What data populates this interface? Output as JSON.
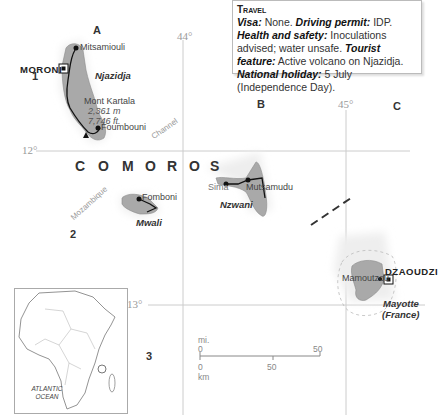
{
  "travel_box": {
    "title": "Travel",
    "items": [
      {
        "label": "Visa:",
        "value": " None. "
      },
      {
        "label": "Driving permit:",
        "value": " IDP. "
      },
      {
        "label": "Health and safety:",
        "value": " Inoculations advised; water unsafe. "
      },
      {
        "label": "Tourist feature:",
        "value": " Active volcano on Njazidja. "
      },
      {
        "label": "National holiday:",
        "value": " 5 July (Independence Day)."
      }
    ]
  },
  "grid": {
    "columns": [
      "A",
      "B",
      "C"
    ],
    "rows": [
      "1",
      "2",
      "3"
    ],
    "longitudes": [
      "44°",
      "45°"
    ],
    "latitudes": [
      "12°",
      "13°"
    ]
  },
  "country": {
    "name_spaced": [
      "C",
      "O",
      "M",
      "O",
      "R",
      "O",
      "S"
    ]
  },
  "islands": {
    "njazidja": "Njazidja",
    "mwali": "Mwali",
    "nzwani": "Nzwani",
    "mayotte": "Mayotte",
    "mayotte_note": "(France)"
  },
  "places": {
    "moroni": "MORONI",
    "mitsamiouli": "Mitsamiouli",
    "foumbouni": "Foumbouni",
    "mont_kartala": "Mont Kartala",
    "kartala_m": "2,361 m",
    "kartala_ft": "7,746 ft.",
    "fomboni": "Fomboni",
    "sima": "Sima",
    "mutsamudu": "Mutsamudu",
    "mamoutzou": "Mamoutzou",
    "dzaoudzi": "DZAOUDZI"
  },
  "water": {
    "channel": "Channel",
    "mozambique": "Mozambique"
  },
  "scale": {
    "mi_unit": "mi.",
    "km_unit": "km",
    "mi_zero": "0",
    "mi_fifty": "50",
    "km_zero": "0",
    "km_fifty": "50"
  },
  "inset": {
    "ocean": "ATLANTIC OCEAN"
  }
}
